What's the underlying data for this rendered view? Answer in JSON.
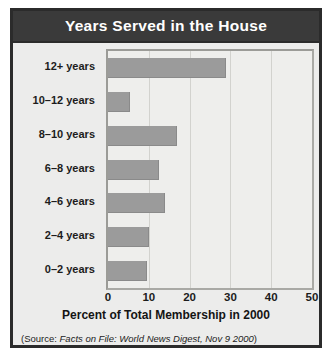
{
  "figure": {
    "title": "Years Served in the House",
    "source_prefix": "(Source: ",
    "source_italic": "Facts on File: World News Digest, Nov 9 2000",
    "source_suffix": ")"
  },
  "colors": {
    "frame": "#2b2b2b",
    "title_bar": "#3a3a3a",
    "title_text": "#ffffff",
    "panel": "#ececeb",
    "plot_bg": "#eeeeec",
    "bar": "#9b9b9b",
    "gridline": "#d2d2ce"
  },
  "chart_data": {
    "type": "bar",
    "orientation": "horizontal",
    "title": "Years Served in the House",
    "xlabel": "Percent of Total Membership in 2000",
    "ylabel": "",
    "xlim": [
      0,
      50
    ],
    "xticks": [
      0,
      10,
      20,
      30,
      40,
      50
    ],
    "grid": true,
    "legend": false,
    "categories": [
      "12+ years",
      "10–12 years",
      "8–10 years",
      "6–8 years",
      "4–6 years",
      "2–4 years",
      "0–2 years"
    ],
    "values": [
      29,
      5.5,
      17,
      12.5,
      14,
      10,
      9.5
    ],
    "series": [
      {
        "name": "Percent of Total Membership in 2000",
        "values": [
          29,
          5.5,
          17,
          12.5,
          14,
          10,
          9.5
        ]
      }
    ]
  }
}
